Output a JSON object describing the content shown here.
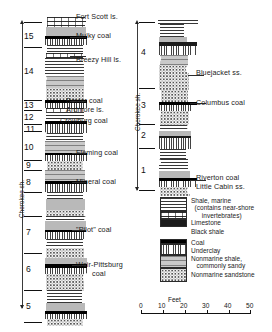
{
  "figure": {
    "kind": "stratigraphic-column",
    "scale_units": "Feet"
  },
  "left_column": {
    "vertical_label": "Cherokee sh.",
    "unit_numbers": [
      "15",
      "14",
      "13",
      "12",
      "11",
      "10",
      "9",
      "8",
      "7",
      "6",
      "5"
    ],
    "bed_labels": [
      "Fort Scott ls.",
      "Mulky coal",
      "Breezy Hill ls.",
      "Bevier coal",
      "Ardmore ls.",
      "Crowburg coal",
      "Fleming coal",
      "Mineral coal",
      "\"Pilot\" coal",
      "Weir-Pittsburg",
      "coal"
    ]
  },
  "right_column": {
    "vertical_label": "Cherokee sh.",
    "unit_numbers": [
      "4",
      "3",
      "2",
      "1"
    ],
    "bed_labels": [
      "Bluejacket ss.",
      "Columbus coal",
      "Riverton coal",
      "Little Cabin ss."
    ]
  },
  "legend": {
    "items": [
      {
        "pattern": "shale-marine",
        "text": "Shale, marine\n  (contains near-shore\n      invertebrates)"
      },
      {
        "pattern": "limestone",
        "text": "Limestone"
      },
      {
        "pattern": "black-shale",
        "text": "Black shale"
      },
      {
        "pattern": "coal",
        "text": "Coal"
      },
      {
        "pattern": "underclay",
        "text": "Underclay"
      },
      {
        "pattern": "nonmarine-shale",
        "text": "Nonmarine shale,\n   commonly sandy"
      },
      {
        "pattern": "nonmarine-sandstone",
        "text": "Nonmarine sandstone"
      }
    ]
  },
  "scale": {
    "title": "Feet",
    "ticks": [
      "0",
      "10",
      "20",
      "30",
      "40",
      "50"
    ]
  }
}
